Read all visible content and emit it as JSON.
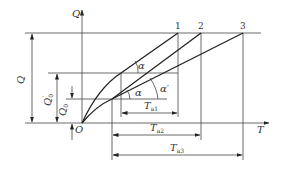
{
  "diagram": {
    "axes": {
      "y_label": "Q",
      "x_label": "T",
      "origin_label": "O"
    },
    "curve_labels": [
      "1",
      "2",
      "3"
    ],
    "dimensions": {
      "Q": "Q",
      "Q0_prime": "Q",
      "Q0_prime_sub": "0",
      "Q0_prime_sup": "′",
      "Q0": "Q",
      "Q0_sub": "0"
    },
    "angles": {
      "alpha_upper": "α",
      "alpha_lower": "α",
      "alpha_prime": "α′"
    },
    "intervals": {
      "Ta1": "T",
      "Ta1_sub": "a1",
      "Ta2": "T",
      "Ta2_sub": "a2",
      "Ta3": "T",
      "Ta3_sub": "a3"
    }
  }
}
